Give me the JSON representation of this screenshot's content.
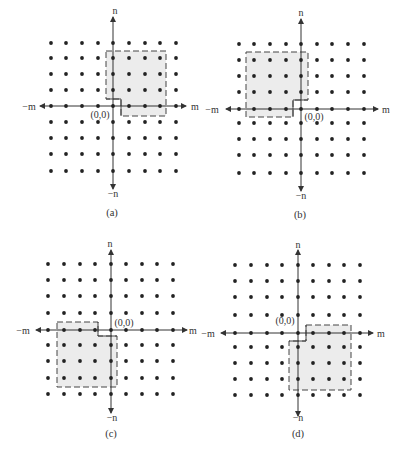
{
  "figure": {
    "colors": {
      "dot": "#222222",
      "axis": "#333333",
      "shade": "#ececec",
      "outline": "#444444",
      "text": "#333333"
    },
    "panels": [
      {
        "id": "a",
        "caption": "(a)",
        "origin_label": "(0,0)",
        "x_pos_label": "m",
        "x_neg_label": "−m",
        "y_pos_label": "n",
        "y_neg_label": "−n",
        "cols": [
          51,
          66,
          82,
          98,
          113,
          129,
          145,
          160,
          176
        ],
        "rows": [
          43,
          58,
          74,
          90,
          106,
          122,
          138,
          154,
          171
        ],
        "axis_x": 113,
        "axis_y": 106,
        "axis_h": [
          40,
          186
        ],
        "axis_v": [
          17,
          189
        ],
        "label_pos": {
          "n": [
            115,
            14
          ],
          "neg_n": [
            113,
            197
          ],
          "m": [
            195,
            110
          ],
          "neg_m": [
            29,
            110
          ],
          "origin": [
            100,
            118
          ],
          "caption": [
            112,
            216
          ]
        },
        "region": [
          [
            106,
            51
          ],
          [
            166,
            51
          ],
          [
            166,
            116
          ],
          [
            121,
            116
          ],
          [
            121,
            99
          ],
          [
            106,
            99
          ]
        ],
        "solid_edges": [
          [
            [
              106,
              99
            ],
            [
              121,
              99
            ]
          ],
          [
            [
              121,
              99
            ],
            [
              121,
              116
            ]
          ]
        ]
      },
      {
        "id": "b",
        "caption": "(b)",
        "origin_label": "(0,0)",
        "x_pos_label": "m",
        "x_neg_label": "−m",
        "y_pos_label": "n",
        "y_neg_label": "−n",
        "cols": [
          239,
          254,
          270,
          286,
          301,
          317,
          332,
          348,
          364
        ],
        "rows": [
          44,
          60,
          76,
          92,
          109,
          123,
          139,
          155,
          173
        ],
        "axis_x": 301,
        "axis_y": 109,
        "axis_h": [
          226,
          378
        ],
        "axis_v": [
          19,
          191
        ],
        "label_pos": {
          "n": [
            301,
            16
          ],
          "neg_n": [
            301,
            199
          ],
          "m": [
            386,
            113
          ],
          "neg_m": [
            212,
            113
          ],
          "origin": [
            314,
            120
          ],
          "caption": [
            300,
            218
          ]
        },
        "region": [
          [
            246,
            52
          ],
          [
            308,
            52
          ],
          [
            308,
            100
          ],
          [
            293,
            100
          ],
          [
            293,
            117
          ],
          [
            246,
            117
          ]
        ],
        "solid_edges": [
          [
            [
              308,
              100
            ],
            [
              293,
              100
            ]
          ],
          [
            [
              293,
              100
            ],
            [
              293,
              117
            ]
          ]
        ]
      },
      {
        "id": "c",
        "caption": "(c)",
        "origin_label": "(0,0)",
        "x_pos_label": "m",
        "x_neg_label": "−m",
        "y_pos_label": "n",
        "y_neg_label": "−n",
        "cols": [
          48,
          64,
          80,
          95,
          111,
          126,
          142,
          157,
          173
        ],
        "rows": [
          264,
          280,
          296,
          313,
          330,
          345,
          361,
          378,
          394
        ],
        "axis_x": 111,
        "axis_y": 330,
        "axis_h": [
          36,
          187
        ],
        "axis_v": [
          250,
          413
        ],
        "label_pos": {
          "n": [
            110,
            247
          ],
          "neg_n": [
            112,
            421
          ],
          "m": [
            193,
            334
          ],
          "neg_m": [
            23,
            334
          ],
          "origin": [
            124,
            326
          ],
          "caption": [
            111,
            437
          ]
        },
        "region": [
          [
            57,
            322
          ],
          [
            98,
            322
          ],
          [
            98,
            336
          ],
          [
            117,
            336
          ],
          [
            117,
            387
          ],
          [
            57,
            387
          ]
        ],
        "solid_edges": [
          [
            [
              98,
              322
            ],
            [
              98,
              336
            ]
          ],
          [
            [
              98,
              336
            ],
            [
              117,
              336
            ]
          ]
        ]
      },
      {
        "id": "d",
        "caption": "(d)",
        "origin_label": "(0,0)",
        "x_pos_label": "m",
        "x_neg_label": "−m",
        "y_pos_label": "n",
        "y_neg_label": "−n",
        "cols": [
          235,
          251,
          267,
          282,
          298,
          313,
          329,
          344,
          360
        ],
        "rows": [
          265,
          281,
          297,
          315,
          333,
          347,
          363,
          379,
          395
        ],
        "axis_x": 298,
        "axis_y": 333,
        "axis_h": [
          221,
          373
        ],
        "axis_v": [
          250,
          416
        ],
        "label_pos": {
          "n": [
            298,
            248
          ],
          "neg_n": [
            298,
            421
          ],
          "m": [
            381,
            337
          ],
          "neg_m": [
            208,
            337
          ],
          "origin": [
            285,
            324
          ],
          "caption": [
            298,
            437
          ]
        },
        "region": [
          [
            306,
            325
          ],
          [
            351,
            325
          ],
          [
            351,
            390
          ],
          [
            289,
            390
          ],
          [
            289,
            341
          ],
          [
            306,
            341
          ]
        ],
        "solid_edges": [
          [
            [
              289,
              341
            ],
            [
              306,
              341
            ]
          ],
          [
            [
              306,
              341
            ],
            [
              306,
              325
            ]
          ]
        ]
      }
    ]
  }
}
